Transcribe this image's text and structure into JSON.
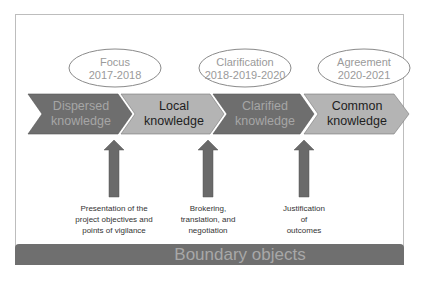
{
  "phases": [
    {
      "name": "Focus",
      "years": "2017-2018"
    },
    {
      "name": "Clarification",
      "years": "2018-2019-2020"
    },
    {
      "name": "Agreement",
      "years": "2020-2021"
    }
  ],
  "stages": [
    {
      "line1": "Dispersed",
      "line2": "knowledge",
      "fill": "#6e6e6e",
      "text_color": "#a6a6a6"
    },
    {
      "line1": "Local",
      "line2": "knowledge",
      "fill": "#b4b4b4",
      "text_color": "#1e1e1e"
    },
    {
      "line1": "Clarified",
      "line2": "knowledge",
      "fill": "#6e6e6e",
      "text_color": "#a6a6a6"
    },
    {
      "line1": "Common",
      "line2": "knowledge",
      "fill": "#b4b4b4",
      "text_color": "#1e1e1e"
    }
  ],
  "actions": [
    {
      "line1": "Presentation of the",
      "line2": "project objectives and",
      "line3": "points of vigilance"
    },
    {
      "line1": "Brokering,",
      "line2": "translation, and",
      "line3": "negotiation"
    },
    {
      "line1": "Justification",
      "line2": "of",
      "line3": "outcomes"
    }
  ],
  "footer": {
    "label": "Boundary objects"
  },
  "colors": {
    "dark": "#6e6e6e",
    "light": "#b4b4b4",
    "arrow": "#6a6a6a",
    "ellipse_text": "#9a9a9a"
  }
}
